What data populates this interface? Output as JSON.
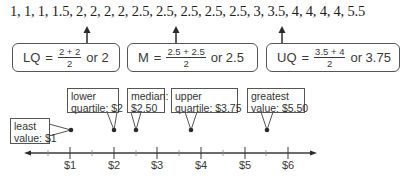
{
  "data_list": "1, 1, 1, 1.5, 2, 2, 2, 2, 2.5, 2.5, 2.5, 2.5, 2.5, 3, 3.5, 4, 4, 4, 4, 5.5",
  "formulas": [
    {
      "lhs": "LQ",
      "eq": "=",
      "numerator": "2 + 2",
      "denominator": "2",
      "result": "or 2"
    },
    {
      "lhs": "M",
      "eq": "=",
      "numerator": "2.5 + 2.5",
      "denominator": "2",
      "result": "or 2.5"
    },
    {
      "lhs": "UQ",
      "eq": "=",
      "numerator": "3.5 + 4",
      "denominator": "2",
      "result": "or 3.75"
    }
  ],
  "callouts": [
    {
      "line1": "least",
      "line2": "value: $1",
      "value": 1
    },
    {
      "line1": "lower",
      "line2": "quartile: $2",
      "value": 2
    },
    {
      "line1": "median:",
      "line2": "$2.50",
      "value": 2.5
    },
    {
      "line1": "upper",
      "line2": "quartile: $3.75",
      "value": 3.75
    },
    {
      "line1": "greatest",
      "line2": "value: $5.50",
      "value": 5.5
    }
  ],
  "axis": {
    "tick_labels": [
      "$1",
      "$2",
      "$3",
      "$4",
      "$5",
      "$6"
    ],
    "min": 0.5,
    "max": 6.5,
    "minor_step": 0.5
  },
  "colors": {
    "line": "#3a3a3a",
    "box_border": "#555555",
    "text": "#2a2a2a"
  }
}
